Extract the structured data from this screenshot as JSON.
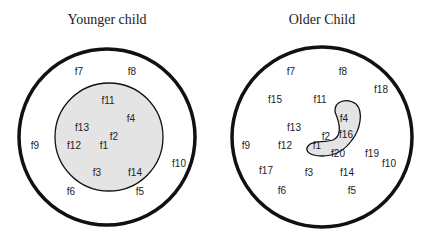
{
  "diagrams": [
    {
      "title": "Younger child",
      "center_x": 107,
      "labels": [
        {
          "text": "f7",
          "x": 79,
          "y": 71
        },
        {
          "text": "f8",
          "x": 132,
          "y": 71
        },
        {
          "text": "f11",
          "x": 108,
          "y": 100
        },
        {
          "text": "f4",
          "x": 131,
          "y": 118
        },
        {
          "text": "f13",
          "x": 82,
          "y": 127
        },
        {
          "text": "f2",
          "x": 114,
          "y": 136
        },
        {
          "text": "f12",
          "x": 74,
          "y": 145
        },
        {
          "text": "f1",
          "x": 104,
          "y": 145
        },
        {
          "text": "f9",
          "x": 35,
          "y": 145
        },
        {
          "text": "f10",
          "x": 179,
          "y": 163
        },
        {
          "text": "f3",
          "x": 97,
          "y": 172
        },
        {
          "text": "f14",
          "x": 135,
          "y": 172
        },
        {
          "text": "f6",
          "x": 71,
          "y": 191
        },
        {
          "text": "f5",
          "x": 140,
          "y": 191
        }
      ]
    },
    {
      "title": "Older Child",
      "center_x": 322,
      "labels": [
        {
          "text": "f7",
          "x": 291,
          "y": 71
        },
        {
          "text": "f8",
          "x": 343,
          "y": 71
        },
        {
          "text": "f18",
          "x": 381,
          "y": 89
        },
        {
          "text": "f15",
          "x": 275,
          "y": 99
        },
        {
          "text": "f11",
          "x": 320,
          "y": 99
        },
        {
          "text": "f4",
          "x": 344,
          "y": 118
        },
        {
          "text": "f13",
          "x": 294,
          "y": 127
        },
        {
          "text": "f2",
          "x": 326,
          "y": 136
        },
        {
          "text": "f16",
          "x": 346,
          "y": 134
        },
        {
          "text": "f9",
          "x": 246,
          "y": 145
        },
        {
          "text": "f12",
          "x": 285,
          "y": 145
        },
        {
          "text": "f1",
          "x": 317,
          "y": 145
        },
        {
          "text": "f20",
          "x": 338,
          "y": 153
        },
        {
          "text": "f19",
          "x": 372,
          "y": 153
        },
        {
          "text": "f10",
          "x": 389,
          "y": 163
        },
        {
          "text": "f17",
          "x": 266,
          "y": 170
        },
        {
          "text": "f3",
          "x": 309,
          "y": 172
        },
        {
          "text": "f14",
          "x": 347,
          "y": 172
        },
        {
          "text": "f6",
          "x": 282,
          "y": 190
        },
        {
          "text": "f5",
          "x": 352,
          "y": 190
        }
      ]
    }
  ],
  "colors": {
    "stroke": "#111111",
    "fill": "#e4e4e4"
  }
}
